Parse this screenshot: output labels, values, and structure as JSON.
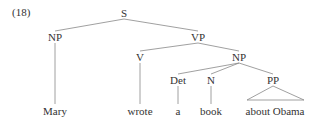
{
  "example_number": "(18)",
  "tree": {
    "nodes": [
      {
        "id": "S",
        "label": "S",
        "x": 124,
        "y": 13
      },
      {
        "id": "NP1",
        "label": "NP",
        "x": 55,
        "y": 37
      },
      {
        "id": "VP",
        "label": "VP",
        "x": 198,
        "y": 37
      },
      {
        "id": "V",
        "label": "V",
        "x": 140,
        "y": 57
      },
      {
        "id": "NP2",
        "label": "NP",
        "x": 239,
        "y": 57
      },
      {
        "id": "Det",
        "label": "Det",
        "x": 178,
        "y": 80
      },
      {
        "id": "N",
        "label": "N",
        "x": 211,
        "y": 80
      },
      {
        "id": "PP",
        "label": "PP",
        "x": 273,
        "y": 80
      },
      {
        "id": "w1",
        "label": "Mary",
        "x": 55,
        "y": 111
      },
      {
        "id": "w2",
        "label": "wrote",
        "x": 140,
        "y": 111
      },
      {
        "id": "w3",
        "label": "a",
        "x": 178,
        "y": 111
      },
      {
        "id": "w4",
        "label": "book",
        "x": 211,
        "y": 111
      },
      {
        "id": "w5",
        "label": "about Obama",
        "x": 275,
        "y": 111
      }
    ],
    "labels": {
      "S": "S",
      "NP1": "NP",
      "VP": "VP",
      "V": "V",
      "NP2": "NP",
      "Det": "Det",
      "N": "N",
      "PP": "PP",
      "w1": "Mary",
      "w2": "wrote",
      "w3": "a",
      "w4": "book",
      "w5": "about Obama"
    }
  }
}
